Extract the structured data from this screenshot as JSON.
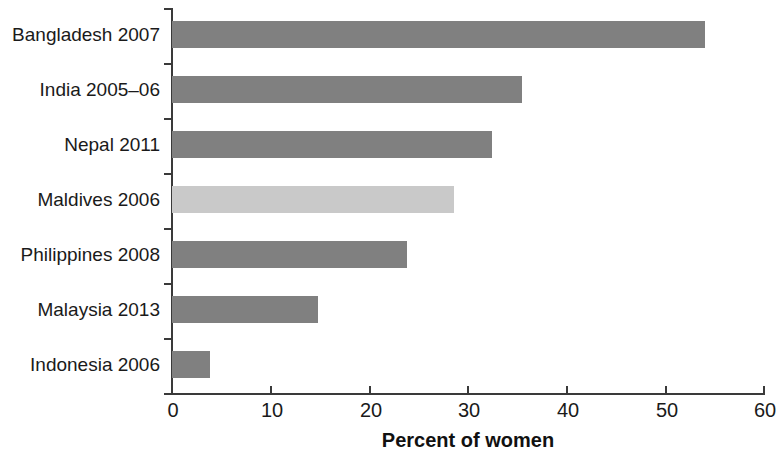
{
  "chart_data": {
    "type": "bar",
    "orientation": "horizontal",
    "title": "",
    "subtitle": "",
    "xlabel": "Percent of women",
    "ylabel": "",
    "xlim": [
      0,
      60
    ],
    "xticks": [
      0,
      10,
      20,
      30,
      40,
      50,
      60
    ],
    "xtick_labels": [
      "0",
      "10",
      "20",
      "30",
      "40",
      "50",
      "60"
    ],
    "grid": false,
    "legend": null,
    "categories": [
      "Bangladesh 2007",
      "India 2005–06",
      "Nepal 2011",
      "Maldives 2006",
      "Philippines 2008",
      "Malaysia 2013",
      "Indonesia 2006"
    ],
    "values": [
      54.0,
      35.5,
      32.4,
      28.6,
      23.8,
      14.8,
      3.9
    ],
    "bar_colors": [
      "#808080",
      "#808080",
      "#808080",
      "#c9c9c9",
      "#808080",
      "#808080",
      "#808080"
    ],
    "highlighted_category": "Maldives 2006",
    "series": [
      {
        "name": "Percent of women",
        "values": [
          54.0,
          35.5,
          32.4,
          28.6,
          23.8,
          14.8,
          3.9
        ]
      }
    ],
    "colors": {
      "bar_default": "#808080",
      "bar_highlight": "#c9c9c9",
      "axis": "#3a3a3a",
      "text": "#1a1a1a",
      "background": "#ffffff"
    }
  }
}
